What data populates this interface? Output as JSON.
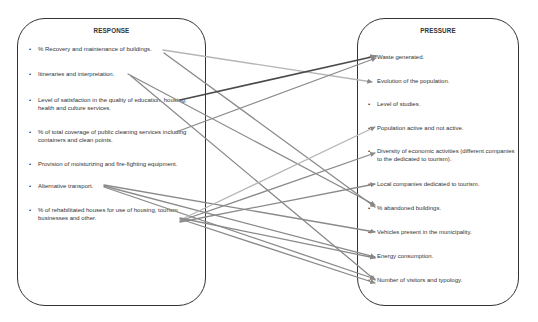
{
  "response": {
    "title": "RESPONSE",
    "items": [
      "% Recovery and maintenance of buildings.",
      "Itineraries and interpretation.",
      "Level of satisfaction in the quality of education, housing, health and culture services.",
      "% of total coverage of public cleaning services including containers and clean points.",
      "Provision of moisturizing and fire-fighting equipment.",
      "Alternative transport.",
      "% of rehabilitated houses for use of housing, tourism businesses and other."
    ]
  },
  "pressure": {
    "title": "PRESSURE",
    "items": [
      "Waste generated.",
      "Evolution of the population.",
      "Level of studies.",
      "Population active and not active.",
      "Diversity of economic activities (different companies to the dedicated to tourism).",
      "Local companies dedicated to tourism.",
      "% abandoned buildings.",
      "Vehicles present in the municipality.",
      "Energy consumption.",
      "Number of visitors and typology."
    ]
  },
  "bullet": "•",
  "links": [
    {
      "from": "% Recovery and maintenance of buildings.",
      "to": "Evolution of the population.",
      "x1": 163,
      "y1": 50,
      "x2": 372,
      "y2": 82,
      "color": "#b5b5b5"
    },
    {
      "from": "% Recovery and maintenance of buildings.",
      "to": "% abandoned buildings.",
      "x1": 164,
      "y1": 53,
      "x2": 375,
      "y2": 207,
      "color": "#8a8a8a"
    },
    {
      "from": "Itineraries and interpretation.",
      "to": "% abandoned buildings.",
      "x1": 128,
      "y1": 74,
      "x2": 375,
      "y2": 205,
      "color": "#8a8a8a"
    },
    {
      "from": "Itineraries and interpretation.",
      "to": "Number of visitors and typology.",
      "x1": 131,
      "y1": 76,
      "x2": 375,
      "y2": 280,
      "color": "#8a8a8a"
    },
    {
      "from": "Level of satisfaction in the quality of education, housing, health and culture services.",
      "to": "Waste generated.",
      "x1": 180,
      "y1": 100,
      "x2": 376,
      "y2": 56,
      "color": "#4a4a4a"
    },
    {
      "from": "% of total coverage of public cleaning services including containers and clean points.",
      "to": "Waste generated.",
      "x1": 176,
      "y1": 132,
      "x2": 376,
      "y2": 58,
      "color": "#8a8a8a"
    },
    {
      "from": "Alternative transport.",
      "to": "Vehicles present in the municipality.",
      "x1": 104,
      "y1": 185,
      "x2": 375,
      "y2": 232,
      "color": "#8a8a8a"
    },
    {
      "from": "Alternative transport.",
      "to": "Energy consumption.",
      "x1": 104,
      "y1": 186,
      "x2": 375,
      "y2": 257,
      "color": "#8a8a8a"
    },
    {
      "from": "Alternative transport.",
      "to": "Number of visitors and typology.",
      "x1": 104,
      "y1": 187,
      "x2": 375,
      "y2": 279,
      "color": "#8a8a8a"
    },
    {
      "from": "% of rehabilitated houses for use of housing, tourism businesses and other.",
      "to": "Population active and not active.",
      "x1": 180,
      "y1": 220,
      "x2": 375,
      "y2": 127,
      "color": "#b5b5b5"
    },
    {
      "from": "% of rehabilitated houses for use of housing, tourism businesses and other.",
      "to": "Diversity of economic activities (different companies to the dedicated to tourism).",
      "x1": 180,
      "y1": 221,
      "x2": 375,
      "y2": 153,
      "color": "#8a8a8a"
    },
    {
      "from": "% of rehabilitated houses for use of housing, tourism businesses and other.",
      "to": "Local companies dedicated to tourism.",
      "x1": 180,
      "y1": 222,
      "x2": 375,
      "y2": 184,
      "color": "#8a8a8a"
    },
    {
      "from": "% of rehabilitated houses for use of housing, tourism businesses and other.",
      "to": "Energy consumption.",
      "x1": 180,
      "y1": 218,
      "x2": 375,
      "y2": 258,
      "color": "#8a8a8a"
    },
    {
      "from": "% of rehabilitated houses for use of housing, tourism businesses and other.",
      "to": "Number of visitors and typology.",
      "x1": 180,
      "y1": 219,
      "x2": 375,
      "y2": 283,
      "color": "#8a8a8a"
    }
  ]
}
